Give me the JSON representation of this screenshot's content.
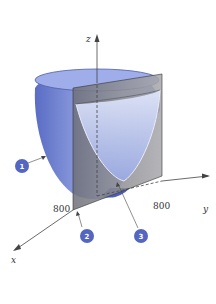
{
  "figure": {
    "axes": {
      "x": {
        "label": "x",
        "tick": "800"
      },
      "y": {
        "label": "y",
        "tick": "800"
      },
      "z": {
        "label": "z"
      }
    },
    "callouts": [
      {
        "id": "1",
        "label": "1",
        "target": "paraboloid-surface"
      },
      {
        "id": "2",
        "label": "2",
        "target": "origin-corner"
      },
      {
        "id": "3",
        "label": "3",
        "target": "intersection-curve"
      }
    ],
    "colors": {
      "surface": "#7e8fd6",
      "surface_dark": "#4d5fb8",
      "surface_light": "#c9d2f0",
      "plane": "#8c8c8c",
      "callout": "#5566c0",
      "axis": "#444444"
    }
  }
}
